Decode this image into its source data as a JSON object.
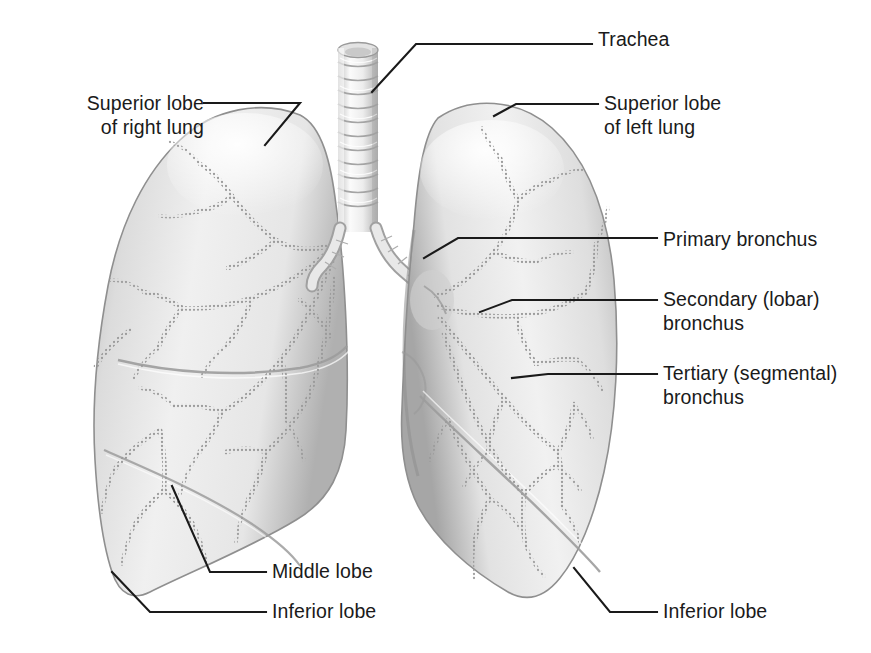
{
  "figure": {
    "type": "anatomical-illustration",
    "style": "grayscale shaded line art",
    "background_color": "#ffffff",
    "ink_color": "#1a1a1a",
    "tissue_light": "#f2f2f2",
    "tissue_mid": "#dcdcdc",
    "tissue_shadow": "#a8a8a8",
    "bronchi_color": "#9a9a9a"
  },
  "labels": [
    {
      "id": "trachea",
      "text": "Trachea",
      "lines": [
        "Trachea"
      ],
      "align": "left",
      "x": 598,
      "y": 28,
      "target": "trachea tube, upper midline"
    },
    {
      "id": "sup-lobe-right",
      "text": "Superior lobe of right lung",
      "lines": [
        "Superior lobe",
        "of right lung"
      ],
      "align": "right",
      "x": 31,
      "y": 92,
      "target": "upper right lung"
    },
    {
      "id": "sup-lobe-left",
      "text": "Superior lobe of left lung",
      "lines": [
        "Superior lobe",
        "of left lung"
      ],
      "align": "left",
      "x": 604,
      "y": 92,
      "target": "upper left lung"
    },
    {
      "id": "primary-bronchus",
      "text": "Primary bronchus",
      "lines": [
        "Primary bronchus"
      ],
      "align": "left",
      "x": 663,
      "y": 228,
      "target": "main bronchus at hilum"
    },
    {
      "id": "secondary-bronchus",
      "text": "Secondary (lobar) bronchus",
      "lines": [
        "Secondary (lobar)",
        "bronchus"
      ],
      "align": "left",
      "x": 663,
      "y": 288,
      "target": "lobar bronchus"
    },
    {
      "id": "tertiary-bronchus",
      "text": "Tertiary (segmental) bronchus",
      "lines": [
        "Tertiary (segmental)",
        "bronchus"
      ],
      "align": "left",
      "x": 663,
      "y": 362,
      "target": "segmental bronchus"
    },
    {
      "id": "middle-lobe",
      "text": "Middle lobe",
      "lines": [
        "Middle lobe"
      ],
      "align": "left",
      "x": 272,
      "y": 560,
      "target": "middle lobe of right lung"
    },
    {
      "id": "inferior-lobe-right",
      "text": "Inferior lobe",
      "lines": [
        "Inferior lobe"
      ],
      "align": "left",
      "x": 272,
      "y": 600,
      "target": "inferior lobe of right lung"
    },
    {
      "id": "inferior-lobe-left",
      "text": "Inferior lobe",
      "lines": [
        "Inferior lobe"
      ],
      "align": "left",
      "x": 663,
      "y": 600,
      "target": "inferior lobe of left lung"
    }
  ]
}
